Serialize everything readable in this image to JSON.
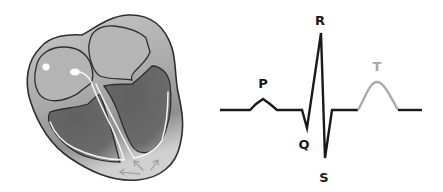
{
  "diagram": {
    "title": "",
    "heart": {
      "description": "Cross-section of heart showing atria, ventricles and conduction pathway",
      "colors": {
        "outline": "#2e2e2e",
        "wall": "#c2c2c2",
        "atria": "#b2b2b2",
        "ventricles": "#666666",
        "conduction": "#f4f4f4"
      }
    },
    "ecg": {
      "labels": {
        "P": "P",
        "Q": "Q",
        "R": "R",
        "S": "S",
        "T": "T"
      },
      "colors": {
        "trace": "#1a1a1a",
        "t_wave": "#ababab",
        "t_label": "#a8a8a8",
        "label": "#1a1a1a"
      }
    }
  }
}
